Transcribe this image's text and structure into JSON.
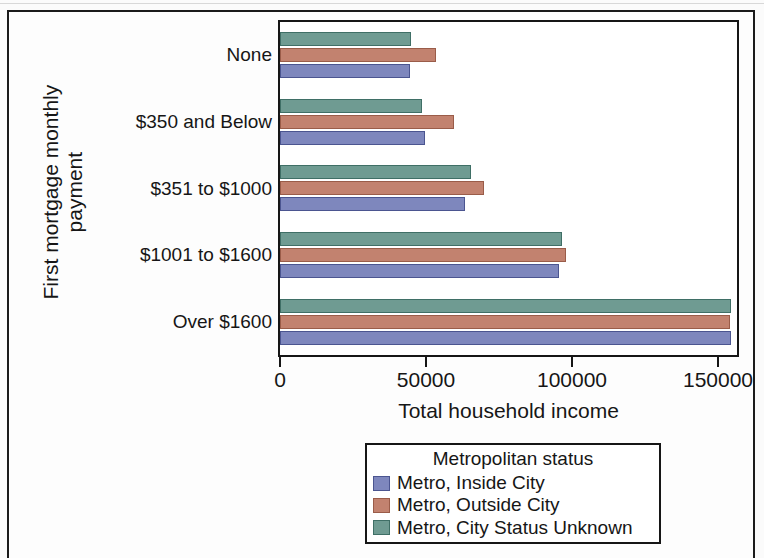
{
  "chart_data": {
    "type": "bar",
    "orientation": "horizontal",
    "title": "",
    "xlabel": "Total household income",
    "ylabel": "First mortgage monthly payment",
    "ylabel_line1": "First mortgage monthly",
    "ylabel_line2": "payment",
    "categories": [
      "None",
      "$350 and Below",
      "$351 to $1000",
      "$1001 to $1600",
      "Over $1600"
    ],
    "xlim": [
      0,
      157000
    ],
    "xticks": [
      0,
      50000,
      100000,
      150000
    ],
    "xtick_labels": [
      "0",
      "50000",
      "100000",
      "150000"
    ],
    "grid": false,
    "legend_position": "below-center",
    "legend_title": "Metropolitan status",
    "series": [
      {
        "name": "Metro, Inside City",
        "color": "#7e87bd",
        "values": [
          44500,
          49500,
          63500,
          95500,
          154500
        ]
      },
      {
        "name": "Metro, Outside City",
        "color": "#c2826f",
        "values": [
          53500,
          59500,
          70000,
          98000,
          154000
        ]
      },
      {
        "name": "Metro, City Status Unknown",
        "color": "#6f9b92",
        "values": [
          45000,
          48500,
          65500,
          96500,
          154500
        ]
      }
    ]
  }
}
